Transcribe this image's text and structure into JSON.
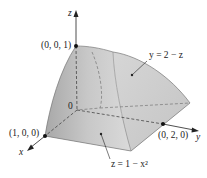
{
  "figure": {
    "axes": {
      "x_label": "x",
      "y_label": "y",
      "z_label": "z",
      "origin_label": "0"
    },
    "points": {
      "p_z": "(0, 0, 1)",
      "p_x": "(1, 0, 0)",
      "p_y": "(0, 2, 0)"
    },
    "surfaces": {
      "plane_label": "y = 2 − z",
      "cylinder_label": "z = 1 − x²"
    },
    "colors": {
      "front_face": "#b9b9b9",
      "side_face": "#d4d4d4",
      "bottom_face": "#c6c6c6",
      "edge": "#555555",
      "axis": "#222222"
    }
  }
}
